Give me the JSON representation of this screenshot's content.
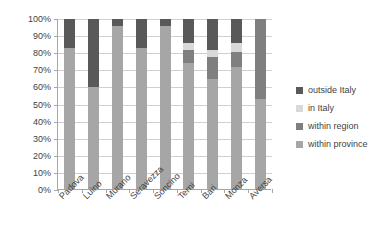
{
  "chart_data": {
    "type": "bar",
    "subtype": "stacked-100-percent",
    "title": "",
    "xlabel": "",
    "ylabel": "",
    "ylim": [
      0,
      100
    ],
    "grid": true,
    "legend_position": "right",
    "categories": [
      "Padova",
      "Luino",
      "Murano",
      "Seravezza",
      "Soncino",
      "Terni",
      "Bari",
      "Monza",
      "Aversa"
    ],
    "ytick_labels": [
      "0%",
      "10%",
      "20%",
      "30%",
      "40%",
      "50%",
      "60%",
      "70%",
      "80%",
      "90%",
      "100%"
    ],
    "ytick_values": [
      0,
      10,
      20,
      30,
      40,
      50,
      60,
      70,
      80,
      90,
      100
    ],
    "series": [
      {
        "name": "within province",
        "color": "#a6a6a6",
        "values": [
          83,
          60,
          96,
          83,
          96,
          74,
          65,
          72,
          53
        ]
      },
      {
        "name": "within region",
        "color": "#7f7f7f",
        "values": [
          0,
          0,
          0,
          0,
          0,
          8,
          13,
          9,
          47
        ]
      },
      {
        "name": "in Italy",
        "color": "#d9d9d9",
        "values": [
          0,
          0,
          0,
          0,
          0,
          4,
          4,
          5,
          0
        ]
      },
      {
        "name": "outside Italy",
        "color": "#595959",
        "values": [
          17,
          40,
          4,
          17,
          4,
          14,
          18,
          14,
          0
        ]
      }
    ]
  },
  "legend": {
    "items": [
      {
        "label": "outside Italy",
        "color": "#595959"
      },
      {
        "label": "in Italy",
        "color": "#d9d9d9"
      },
      {
        "label": "within region",
        "color": "#7f7f7f"
      },
      {
        "label": "within province",
        "color": "#a6a6a6"
      }
    ]
  }
}
